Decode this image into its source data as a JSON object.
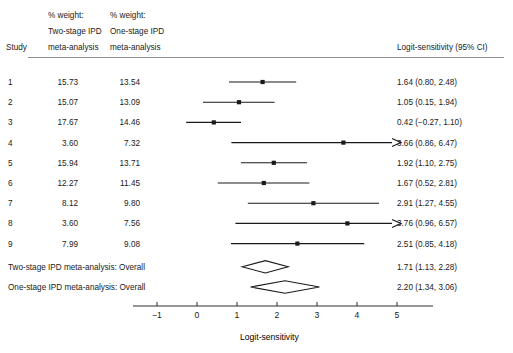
{
  "figure": {
    "type": "forest-plot",
    "axis_title": "Logit-sensitivity",
    "ci_header": "Logit-sensitivity (95% CI)",
    "study_header": "Study",
    "col2_header_lines": [
      "% weight:",
      "Two-stage IPD",
      "meta-analysis"
    ],
    "col3_header_lines": [
      "% weight:",
      "One-stage IPD",
      "meta-analysis"
    ],
    "line_color": "#1a1a1a",
    "text_color": "#1a1a1a",
    "background": "#ffffff"
  },
  "chart_data": {
    "type": "forest",
    "title": "",
    "xlabel": "Logit-sensitivity",
    "ylabel": "",
    "xlim": [
      -1.6,
      5.9
    ],
    "xticks": [
      -1,
      0,
      1,
      2,
      3,
      4,
      5
    ],
    "xticklabels": [
      "−1",
      "0",
      "1",
      "2",
      "3",
      "4",
      "5"
    ],
    "grid": false,
    "clip_right": 5.1,
    "effect_measure": "Logit-sensitivity",
    "rows": [
      {
        "study": "1",
        "w_two": "15.73",
        "w_one": "13.54",
        "est": 1.64,
        "lo": 0.8,
        "hi": 2.48,
        "label": "1.64 (0.80, 2.48)",
        "arrow": false
      },
      {
        "study": "2",
        "w_two": "15.07",
        "w_one": "13.09",
        "est": 1.05,
        "lo": 0.15,
        "hi": 1.94,
        "label": "1.05 (0.15, 1.94)",
        "arrow": false
      },
      {
        "study": "3",
        "w_two": "17.67",
        "w_one": "14.46",
        "est": 0.42,
        "lo": -0.27,
        "hi": 1.1,
        "label": "0.42 (−0.27, 1.10)",
        "arrow": false
      },
      {
        "study": "4",
        "w_two": "3.60",
        "w_one": "7.32",
        "est": 3.66,
        "lo": 0.86,
        "hi": 6.47,
        "label": "3.66 (0.86, 6.47)",
        "arrow": true
      },
      {
        "study": "5",
        "w_two": "15.94",
        "w_one": "13.71",
        "est": 1.92,
        "lo": 1.1,
        "hi": 2.75,
        "label": "1.92 (1.10, 2.75)",
        "arrow": false
      },
      {
        "study": "6",
        "w_two": "12.27",
        "w_one": "11.45",
        "est": 1.67,
        "lo": 0.52,
        "hi": 2.81,
        "label": "1.67 (0.52, 2.81)",
        "arrow": false
      },
      {
        "study": "7",
        "w_two": "8.12",
        "w_one": "9.80",
        "est": 2.91,
        "lo": 1.27,
        "hi": 4.55,
        "label": "2.91 (1.27, 4.55)",
        "arrow": false
      },
      {
        "study": "8",
        "w_two": "3.60",
        "w_one": "7.56",
        "est": 3.76,
        "lo": 0.96,
        "hi": 6.57,
        "label": "3.76 (0.96, 6.57)",
        "arrow": true
      },
      {
        "study": "9",
        "w_two": "7.99",
        "w_one": "9.08",
        "est": 2.51,
        "lo": 0.85,
        "hi": 4.18,
        "label": "2.51 (0.85, 4.18)",
        "arrow": false
      }
    ],
    "summaries": [
      {
        "study": "Two-stage IPD meta-analysis: Overall",
        "est": 1.71,
        "lo": 1.13,
        "hi": 2.28,
        "label": "1.71 (1.13, 2.28)"
      },
      {
        "study": "One-stage IPD meta-analysis: Overall",
        "est": 2.2,
        "lo": 1.34,
        "hi": 3.06,
        "label": "2.20 (1.34, 3.06)"
      }
    ]
  }
}
